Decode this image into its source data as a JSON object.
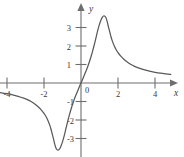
{
  "chart_data": {
    "type": "line",
    "title": "",
    "subtitle": "",
    "xlabel": "x",
    "ylabel": "y",
    "xlim": [
      -4.9,
      5.0
    ],
    "ylim": [
      -4.0,
      4.2
    ],
    "grid": false,
    "legend": null,
    "xticks": [
      -4,
      -2,
      2,
      4
    ],
    "xtick_labels": [
      "-4",
      "-2",
      "2",
      "4"
    ],
    "yticks": [
      -3,
      -2,
      -1,
      1,
      2,
      3
    ],
    "ytick_labels": [
      "-3",
      "-2",
      "-1",
      "1",
      "2",
      "3"
    ],
    "origin_label": "0",
    "axis_color": "#6e6e6e",
    "curve_color": "#595959",
    "text_color": "#3a3a3a",
    "series": [
      {
        "name": "curve",
        "points": [
          [
            -4.85,
            -0.46
          ],
          [
            -4.6,
            -0.49
          ],
          [
            -4.3,
            -0.53
          ],
          [
            -4.0,
            -0.58
          ],
          [
            -3.7,
            -0.64
          ],
          [
            -3.4,
            -0.72
          ],
          [
            -3.1,
            -0.82
          ],
          [
            -2.9,
            -0.9
          ],
          [
            -2.7,
            -1.0
          ],
          [
            -2.5,
            -1.13
          ],
          [
            -2.3,
            -1.3
          ],
          [
            -2.15,
            -1.45
          ],
          [
            -2.0,
            -1.64
          ],
          [
            -1.9,
            -1.8
          ],
          [
            -1.8,
            -2.0
          ],
          [
            -1.7,
            -2.25
          ],
          [
            -1.62,
            -2.5
          ],
          [
            -1.55,
            -2.78
          ],
          [
            -1.48,
            -3.05
          ],
          [
            -1.42,
            -3.3
          ],
          [
            -1.36,
            -3.5
          ],
          [
            -1.3,
            -3.6
          ],
          [
            -1.22,
            -3.62
          ],
          [
            -1.15,
            -3.55
          ],
          [
            -1.08,
            -3.4
          ],
          [
            -1.0,
            -3.18
          ],
          [
            -0.92,
            -2.9
          ],
          [
            -0.85,
            -2.62
          ],
          [
            -0.78,
            -2.32
          ],
          [
            -0.7,
            -2.0
          ],
          [
            -0.62,
            -1.7
          ],
          [
            -0.54,
            -1.42
          ],
          [
            -0.46,
            -1.16
          ],
          [
            -0.38,
            -0.93
          ],
          [
            -0.3,
            -0.72
          ],
          [
            -0.23,
            -0.55
          ],
          [
            -0.16,
            -0.38
          ],
          [
            -0.1,
            -0.23
          ],
          [
            -0.05,
            -0.11
          ],
          [
            0.0,
            0.0
          ],
          [
            0.05,
            0.11
          ],
          [
            0.1,
            0.23
          ],
          [
            0.16,
            0.38
          ],
          [
            0.23,
            0.55
          ],
          [
            0.3,
            0.72
          ],
          [
            0.38,
            0.93
          ],
          [
            0.46,
            1.16
          ],
          [
            0.54,
            1.42
          ],
          [
            0.62,
            1.7
          ],
          [
            0.7,
            2.0
          ],
          [
            0.78,
            2.32
          ],
          [
            0.85,
            2.62
          ],
          [
            0.92,
            2.9
          ],
          [
            1.0,
            3.18
          ],
          [
            1.08,
            3.4
          ],
          [
            1.15,
            3.55
          ],
          [
            1.22,
            3.62
          ],
          [
            1.3,
            3.6
          ],
          [
            1.36,
            3.5
          ],
          [
            1.42,
            3.3
          ],
          [
            1.48,
            3.05
          ],
          [
            1.55,
            2.78
          ],
          [
            1.62,
            2.5
          ],
          [
            1.7,
            2.25
          ],
          [
            1.8,
            2.0
          ],
          [
            1.9,
            1.8
          ],
          [
            2.0,
            1.64
          ],
          [
            2.15,
            1.45
          ],
          [
            2.3,
            1.3
          ],
          [
            2.5,
            1.13
          ],
          [
            2.7,
            1.0
          ],
          [
            2.9,
            0.9
          ],
          [
            3.1,
            0.82
          ],
          [
            3.4,
            0.72
          ],
          [
            3.7,
            0.64
          ],
          [
            4.0,
            0.58
          ],
          [
            4.3,
            0.53
          ],
          [
            4.6,
            0.49
          ],
          [
            4.85,
            0.46
          ]
        ]
      }
    ]
  }
}
